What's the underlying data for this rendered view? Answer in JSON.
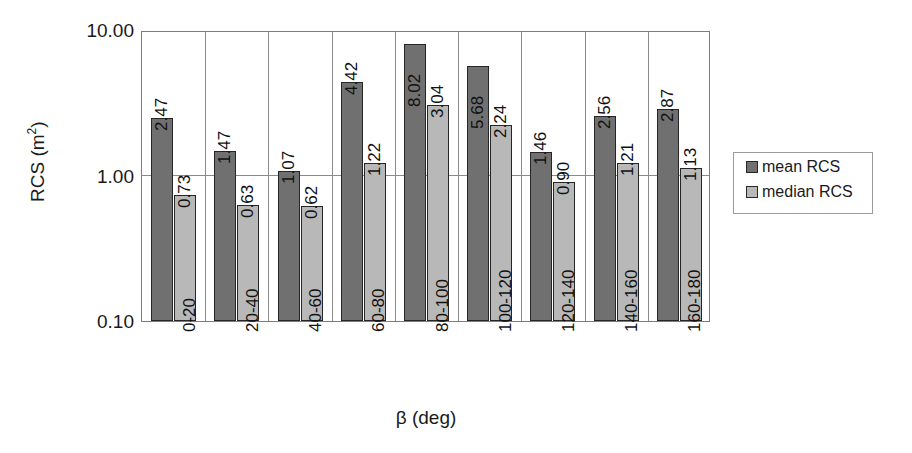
{
  "chart_data": {
    "type": "bar",
    "title": "",
    "xlabel": "β (deg)",
    "ylabel": "RCS (m²)",
    "ylabel_text": "RCS (m",
    "ylabel_sup": "2",
    "ylabel_tail": ")",
    "yscale": "log",
    "ylim": [
      0.1,
      10.0
    ],
    "ytick_labels": [
      "10.00",
      "1.00",
      "0.10"
    ],
    "ytick_values": [
      10.0,
      1.0,
      0.1
    ],
    "grid": "horizontal-at-1.00-plus-category-separators",
    "legend_position": "right",
    "categories": [
      "0-20",
      "20-40",
      "40-60",
      "60-80",
      "80-100",
      "100-120",
      "120-140",
      "140-160",
      "160-180"
    ],
    "series": [
      {
        "name": "mean RCS",
        "color": "#707070",
        "values": [
          2.47,
          1.47,
          1.07,
          4.42,
          8.02,
          5.68,
          1.46,
          2.56,
          2.87
        ],
        "labels": [
          "2.47",
          "1.47",
          "1.07",
          "4.42",
          "8.02",
          "5.68",
          "1.46",
          "2.56",
          "2.87"
        ]
      },
      {
        "name": "median RCS",
        "color": "#b8b8b8",
        "values": [
          0.73,
          0.63,
          0.62,
          1.22,
          3.04,
          2.24,
          0.9,
          1.21,
          1.13
        ],
        "labels": [
          "0.73",
          "0.63",
          "0.62",
          "1.22",
          "3.04",
          "2.24",
          "0.90",
          "1.21",
          "1.13"
        ]
      }
    ]
  },
  "legend": {
    "items": [
      {
        "label": "mean RCS",
        "color": "#707070"
      },
      {
        "label": "median RCS",
        "color": "#b8b8b8"
      }
    ]
  }
}
